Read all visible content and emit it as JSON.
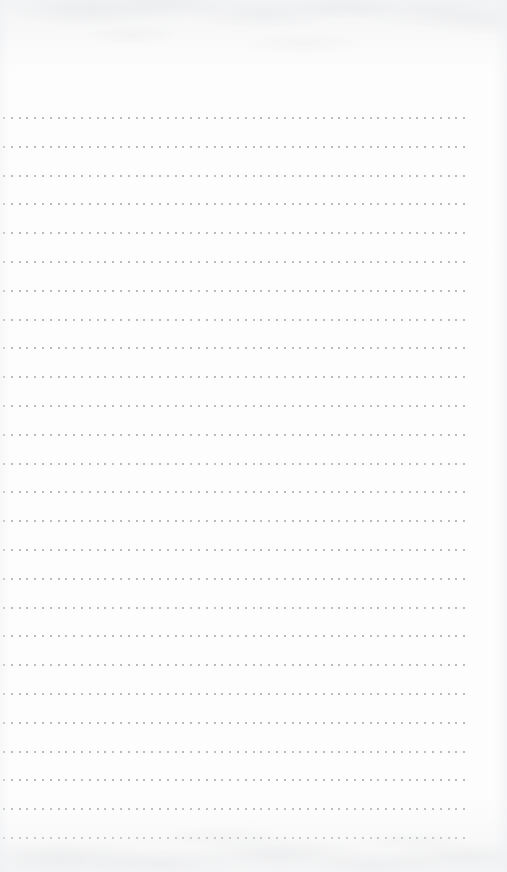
{
  "document": {
    "kind": "scanned-blank-dotted-notebook-page",
    "page_width": 507,
    "page_height": 872,
    "paper_color": "#fdfdfd",
    "has_text": false,
    "has_handwriting": false,
    "visible_text": ""
  },
  "grid": {
    "dot_color": "#a9abaf",
    "dot_size_px": 2,
    "row_count": 26,
    "dots_per_row": 60,
    "first_row_y": 117,
    "row_spacing_y": 28.8,
    "first_dot_x": 3,
    "dot_spacing_x": 7.8,
    "last_row_y": 836,
    "left_margin_px": 3,
    "right_margin_px": 37,
    "top_margin_px": 117,
    "bottom_margin_px": 36
  },
  "texture": {
    "top_mottling": "faint gray scan shading along the upper edge",
    "bottom_mottling": "faint gray scan shading along the lower edge",
    "vignette_color": "#eceded"
  }
}
